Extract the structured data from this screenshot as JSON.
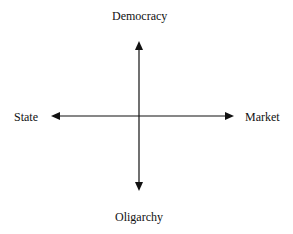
{
  "diagram": {
    "type": "two-axis quadrant diagram",
    "labels": {
      "top": "Democracy",
      "bottom": "Oligarchy",
      "left": "State",
      "right": "Market"
    },
    "colors": {
      "axis": "#111111",
      "text": "#111111",
      "background": "#ffffff"
    }
  }
}
